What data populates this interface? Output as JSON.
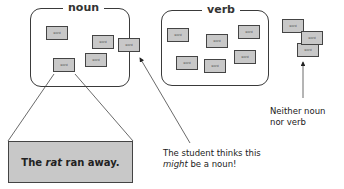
{
  "groups": {
    "noun": {
      "label": "noun"
    },
    "verb": {
      "label": "verb"
    }
  },
  "card_text": "word",
  "sentence": {
    "before": "The ",
    "emph": "rat",
    "after": " ran away."
  },
  "captions": {
    "student": {
      "line1": "The student thinks this",
      "emph": "might",
      "line2_rest": " be a noun!"
    },
    "neither": {
      "line1": "Neither noun",
      "line2": "nor verb"
    }
  },
  "colors": {
    "card_fill": "#c8c8c8",
    "stroke": "#3a3a3a"
  }
}
